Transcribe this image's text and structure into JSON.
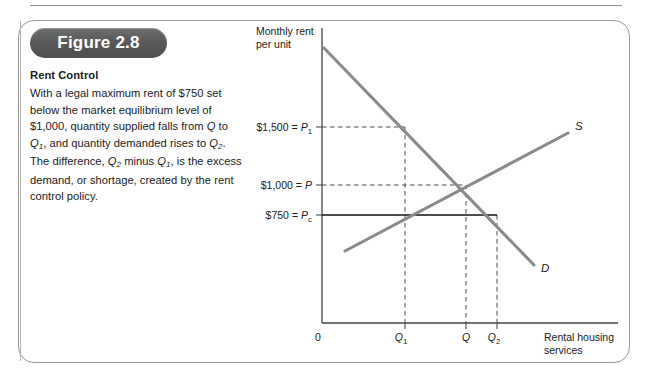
{
  "figure": {
    "badge_label": "Figure 2.8",
    "title": "Rent Control",
    "body_segments": [
      {
        "t": "With a legal maximum rent of $750 set below the market equilibrium level of $1,000, quantity supplied falls from ",
        "style": "normal"
      },
      {
        "t": "Q",
        "style": "italic"
      },
      {
        "t": " to ",
        "style": "normal"
      },
      {
        "t": "Q",
        "style": "italic"
      },
      {
        "t": "1",
        "style": "sub-italic"
      },
      {
        "t": ", and quantity demanded rises to ",
        "style": "normal"
      },
      {
        "t": "Q",
        "style": "italic"
      },
      {
        "t": "2",
        "style": "sub-italic"
      },
      {
        "t": ". The difference, ",
        "style": "normal"
      },
      {
        "t": "Q",
        "style": "italic"
      },
      {
        "t": "2",
        "style": "sub-italic"
      },
      {
        "t": " minus ",
        "style": "normal"
      },
      {
        "t": "Q",
        "style": "italic"
      },
      {
        "t": "1",
        "style": "sub-italic"
      },
      {
        "t": ", is the excess demand, or shortage, created by the rent control policy.",
        "style": "normal"
      }
    ],
    "body_plain": "With a legal maximum rent of $750 set below the market equilibrium level of $1,000, quantity supplied falls from Q to Q1, and quantity demanded rises to Q2. The difference, Q2 minus Q1, is the excess demand, or shortage, created by the rent control policy."
  },
  "chart_data": {
    "type": "line",
    "title": "Rent Control",
    "ylabel_line1": "Monthly rent",
    "ylabel_line2": "per unit",
    "xlabel_line1": "Rental housing",
    "xlabel_line2": "services",
    "grid": false,
    "legend": "inline-curve-labels",
    "y_ticks": [
      {
        "label_money": "$1,500",
        "label_eq": "=",
        "label_var": "P",
        "label_sub": "1",
        "value": 1500
      },
      {
        "label_money": "$1,000",
        "label_eq": "=",
        "label_var": "P",
        "label_sub": "",
        "value": 1000
      },
      {
        "label_money": "$750",
        "label_eq": "=",
        "label_var": "P",
        "label_sub": "c",
        "value": 750
      }
    ],
    "x_ticks": [
      {
        "label_var": "0",
        "label_sub": "",
        "role": "origin"
      },
      {
        "label_var": "Q",
        "label_sub": "1",
        "role": "quantity-supplied-under-ceiling"
      },
      {
        "label_var": "Q",
        "label_sub": "",
        "role": "equilibrium-quantity"
      },
      {
        "label_var": "Q",
        "label_sub": "2",
        "role": "quantity-demanded-under-ceiling"
      }
    ],
    "series": [
      {
        "name": "D",
        "label": "D",
        "type": "demand",
        "description": "downward sloping demand curve"
      },
      {
        "name": "S",
        "label": "S",
        "type": "supply",
        "description": "upward sloping supply curve"
      }
    ],
    "annotations": [
      {
        "name": "price-ceiling-line",
        "value": 750,
        "style": "solid-black-horizontal"
      },
      {
        "name": "equilibrium-dashed",
        "value": 1000,
        "style": "dashed"
      },
      {
        "name": "p1-dashed",
        "value": 1500,
        "style": "dashed"
      }
    ],
    "colors": {
      "curve": "#8a8a8a",
      "axis": "#444444",
      "ceiling": "#111111",
      "badge": "#5e5e5e"
    }
  }
}
